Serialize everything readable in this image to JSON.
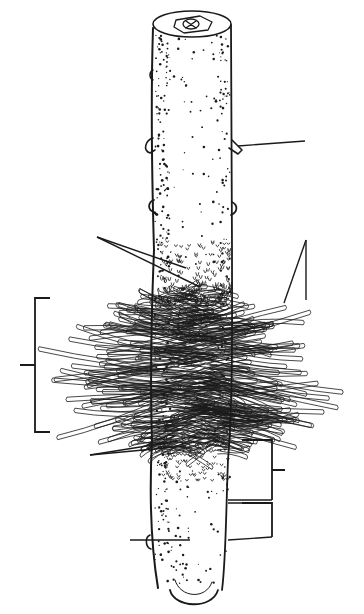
{
  "diagram": {
    "colors": {
      "background": "#ffffff",
      "ink": "#1a1a1a"
    },
    "labels": [],
    "leaders": [
      {
        "id": "stem-lateral-bud",
        "from": [
          238,
          146
        ],
        "to": [
          305,
          141
        ]
      },
      {
        "id": "young-root-hairs-a",
        "from": [
          97,
          237
        ],
        "to": [
          186,
          268
        ]
      },
      {
        "id": "young-root-hairs-b",
        "from": [
          97,
          237
        ],
        "to": [
          200,
          287
        ]
      },
      {
        "id": "root-hair-right-a",
        "from": [
          306,
          240
        ],
        "to": [
          284,
          303
        ]
      },
      {
        "id": "root-hair-right-b",
        "from": [
          306,
          240
        ],
        "to": [
          306,
          300
        ]
      },
      {
        "id": "epidermis-a",
        "from": [
          90,
          455
        ],
        "to": [
          178,
          441
        ]
      },
      {
        "id": "epidermis-b",
        "from": [
          90,
          455
        ],
        "to": [
          186,
          446
        ]
      },
      {
        "id": "root-cap-left",
        "from": [
          130,
          540
        ],
        "to": [
          190,
          540
        ]
      }
    ],
    "brackets": [
      {
        "id": "root-hair-zone",
        "side": "left",
        "x": 35,
        "y1": 298,
        "y2": 432,
        "tick_y": 365
      },
      {
        "id": "elongation-zone",
        "side": "right",
        "x": 272,
        "y1": 440,
        "y2": 500,
        "tick_y": 470
      },
      {
        "id": "meristem-zone",
        "side": "right",
        "x": 272,
        "y1": 503,
        "y2": 537,
        "tick_y": null
      }
    ]
  }
}
